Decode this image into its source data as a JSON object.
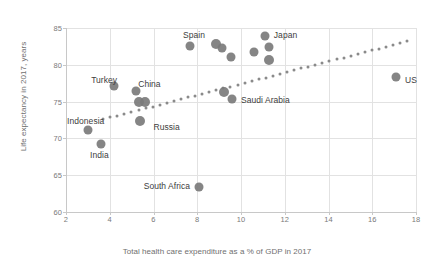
{
  "chart_data": {
    "type": "scatter",
    "title": "",
    "xlabel": "Total health care expenditure as a % of GDP in 2017",
    "ylabel": "Life expectancy in 2017, years",
    "xlim": [
      2,
      18
    ],
    "ylim": [
      60,
      85
    ],
    "xticks": [
      "2",
      "4",
      "6",
      "8",
      "10",
      "12",
      "14",
      "16",
      "18"
    ],
    "yticks": [
      "60",
      "65",
      "70",
      "75",
      "80",
      "85"
    ],
    "grid": true,
    "legend": "none",
    "marker_color": "#7b7b7b",
    "trendline": {
      "style": "dotted",
      "color": "#8a8a8a",
      "x_start": 3.7,
      "y_start": 72.6,
      "x_end": 17.6,
      "y_end": 83.2
    },
    "points": [
      {
        "label": "Indonesia",
        "x": 3.0,
        "y": 71.2,
        "size": 9
      },
      {
        "label": "India",
        "x": 3.6,
        "y": 69.2,
        "size": 9
      },
      {
        "label": "Turkey",
        "x": 4.2,
        "y": 77.1,
        "size": 9
      },
      {
        "label": "China",
        "x": 5.2,
        "y": 76.4,
        "size": 9
      },
      {
        "label": "",
        "x": 5.35,
        "y": 74.9,
        "size": 10
      },
      {
        "label": "",
        "x": 5.6,
        "y": 74.9,
        "size": 10
      },
      {
        "label": "Russia",
        "x": 5.4,
        "y": 72.3,
        "size": 10
      },
      {
        "label": "Spain",
        "x": 7.65,
        "y": 82.5,
        "size": 9
      },
      {
        "label": "South Africa",
        "x": 8.1,
        "y": 63.4,
        "size": 9
      },
      {
        "label": "",
        "x": 8.85,
        "y": 82.8,
        "size": 10
      },
      {
        "label": "",
        "x": 9.15,
        "y": 82.3,
        "size": 9
      },
      {
        "label": "",
        "x": 9.55,
        "y": 81.0,
        "size": 9
      },
      {
        "label": "",
        "x": 9.2,
        "y": 76.3,
        "size": 10
      },
      {
        "label": "",
        "x": 9.6,
        "y": 75.3,
        "size": 9
      },
      {
        "label": "",
        "x": 10.6,
        "y": 81.8,
        "size": 9
      },
      {
        "label": "Japan",
        "x": 11.1,
        "y": 83.9,
        "size": 9
      },
      {
        "label": "",
        "x": 11.3,
        "y": 82.4,
        "size": 9
      },
      {
        "label": "",
        "x": 11.3,
        "y": 80.7,
        "size": 10
      },
      {
        "label": "US",
        "x": 17.1,
        "y": 78.4,
        "size": 9
      }
    ],
    "annotations": [
      {
        "text": "Spain",
        "x": 7.35,
        "y": 84.1,
        "anchor": "start"
      },
      {
        "text": "Japan",
        "x": 11.5,
        "y": 84.1,
        "anchor": "start"
      },
      {
        "text": "US",
        "x": 17.5,
        "y": 78.0,
        "anchor": "start"
      },
      {
        "text": "Turkey",
        "x": 3.15,
        "y": 77.9,
        "anchor": "start"
      },
      {
        "text": "China",
        "x": 5.3,
        "y": 77.4,
        "anchor": "start"
      },
      {
        "text": "Saudi Arabia",
        "x": 10.0,
        "y": 75.2,
        "anchor": "start"
      },
      {
        "text": "Indonesia",
        "x": 2.05,
        "y": 72.3,
        "anchor": "start"
      },
      {
        "text": "Russia",
        "x": 6.0,
        "y": 71.6,
        "anchor": "start"
      },
      {
        "text": "India",
        "x": 3.1,
        "y": 67.7,
        "anchor": "start"
      },
      {
        "text": "South Africa",
        "x": 5.55,
        "y": 63.5,
        "anchor": "start"
      }
    ]
  }
}
